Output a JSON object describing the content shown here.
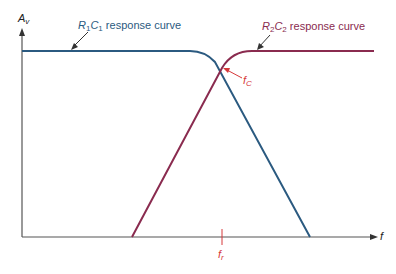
{
  "diagram": {
    "axes": {
      "y_label": "A",
      "y_label_sub": "v",
      "x_label": "f"
    },
    "curves": [
      {
        "name": "R1C1",
        "label_r": "R",
        "label_r_sub": "1",
        "label_c": "C",
        "label_c_sub": "1",
        "label_suffix": " response curve",
        "color": "#2b5a80"
      },
      {
        "name": "R2C2",
        "label_r": "R",
        "label_r_sub": "2",
        "label_c": "C",
        "label_c_sub": "2",
        "label_suffix": " response curve",
        "color": "#8a2b4f"
      }
    ],
    "annotations": {
      "fc_main": "f",
      "fc_sub": "C",
      "fr_main": "f",
      "fr_sub": "r",
      "annotation_color": "#d6383a"
    },
    "colors": {
      "axis": "#555555",
      "arrow": "#333333"
    }
  }
}
